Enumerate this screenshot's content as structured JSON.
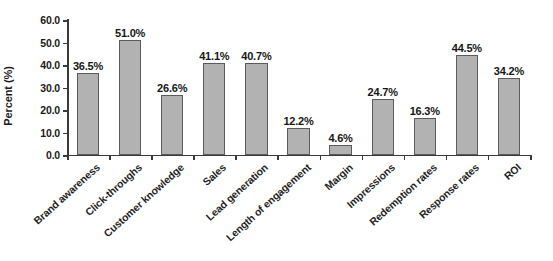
{
  "chart_data": {
    "type": "bar",
    "title": "",
    "xlabel": "",
    "ylabel": "Percent (%)",
    "ylim": [
      0,
      60
    ],
    "ytick_step": 10,
    "grid": false,
    "legend": "none",
    "bar_color": "#b2b2b2",
    "bar_border_color": "#5b5b5b",
    "axis_color": "#3a3a3a",
    "text_color": "#1a1a1a",
    "background": "#ffffff",
    "x_label_rotation_deg": -42,
    "categories": [
      "Brand awareness",
      "Click-throughs",
      "Customer knowledge",
      "Sales",
      "Lead generation",
      "Length of engagement",
      "Margin",
      "Impressions",
      "Redemption rates",
      "Response rates",
      "ROI"
    ],
    "values": [
      36.5,
      51.0,
      26.6,
      41.1,
      40.7,
      12.2,
      4.6,
      24.7,
      16.3,
      44.5,
      34.2
    ],
    "value_labels": [
      "36.5%",
      "51.0%",
      "26.6%",
      "41.1%",
      "40.7%",
      "12.2%",
      "4.6%",
      "24.7%",
      "16.3%",
      "44.5%",
      "34.2%"
    ],
    "ytick_labels": [
      "0.0",
      "10.0",
      "20.0",
      "30.0",
      "40.0",
      "50.0",
      "60.0"
    ],
    "ytick_values": [
      0,
      10,
      20,
      30,
      40,
      50,
      60
    ]
  }
}
